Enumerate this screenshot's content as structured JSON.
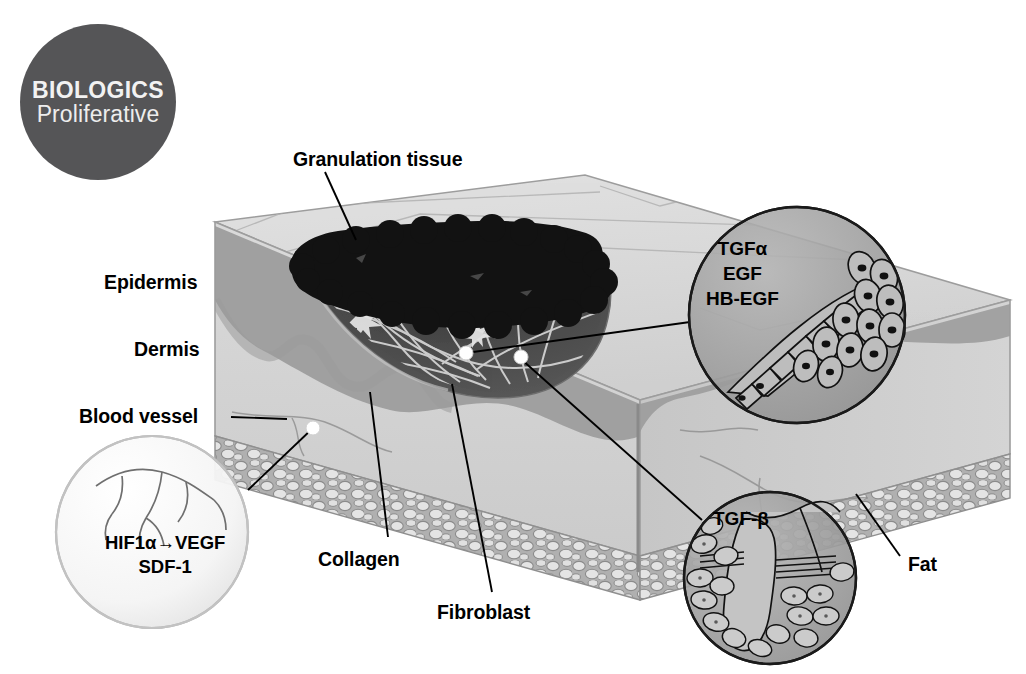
{
  "badge": {
    "line1": "BIOLOGICS",
    "line2": "Proliferative",
    "color": "#555557"
  },
  "diagram": {
    "title_context": "Skin wound healing - proliferative phase",
    "labels": {
      "granulation_tissue": "Granulation tissue",
      "epidermis": "Epidermis",
      "dermis": "Dermis",
      "blood_vessel": "Blood vessel",
      "collagen": "Collagen",
      "fibroblast": "Fibroblast",
      "fat": "Fat"
    },
    "callouts": {
      "tgfa": {
        "line1": "TGFα",
        "line2": "EGF",
        "line3": "HB-EGF"
      },
      "hif": {
        "line1": "HIF1α→VEGF",
        "line2": "SDF-1"
      },
      "tgfb": {
        "line1": "TGF-β"
      }
    }
  },
  "colors": {
    "skin_top": "#d9d9d9",
    "skin_front": "#d2d2d2",
    "skin_side": "#c8c8c8",
    "epidermis_band": "#9b9b9b",
    "dermis": "#d0d0d0",
    "fat_outline": "#8f8f8f",
    "fat_cell": "#dedede",
    "wound_dark": "#4a4a4a",
    "granulation": "#111111",
    "callout_fill": "#9e9e9e",
    "callout_light": "#f4f4f4",
    "leader_line": "#000000",
    "marker_dot": "#ffffff"
  }
}
